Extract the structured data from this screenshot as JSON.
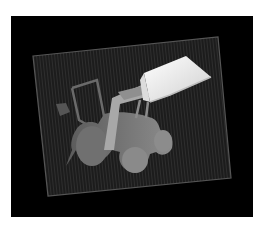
{
  "image": {
    "description": "Depth-map rendering of a toy front-loader tractor with raised bucket on a grid ground plane",
    "subject": "front-loader tractor",
    "colors": {
      "page_background": "#ffffff",
      "frame_background": "#000000",
      "grid_plane": "#1c1c1c",
      "grid_line": "#2c2c2c",
      "grid_border": "#555555",
      "body_near": "#8a8a8a",
      "body_far": "#5e5e5e",
      "bucket_top": "#e6e6e6",
      "bucket_face": "#f2f2f2",
      "arm": "#b0b0b0"
    }
  }
}
